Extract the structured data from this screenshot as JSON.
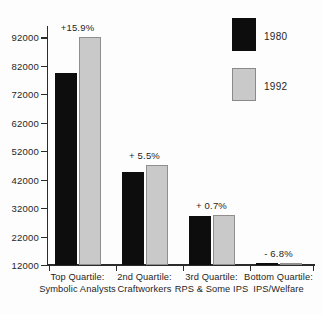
{
  "chart_data": {
    "type": "bar",
    "title": "",
    "subtitle": "",
    "xlabel": "",
    "ylabel": "",
    "ylim": [
      12000,
      96000
    ],
    "grid": false,
    "legend_position": "top-right",
    "categories": [
      "Top Quartile:\nSymbolic Analysts",
      "2nd Quartile:\nCraftworkers",
      "3rd Quartile:\nRPS & Some IPS",
      "Bottom Quartile:\nIPS/Welfare"
    ],
    "category_lines": [
      [
        "Top Quartile:",
        "Symbolic Analysts"
      ],
      [
        "2nd Quartile:",
        "Craftworkers"
      ],
      [
        "3rd Quartile:",
        "RPS & Some IPS"
      ],
      [
        "Bottom Quartile:",
        "IPS/Welfare"
      ]
    ],
    "series": [
      {
        "name": "1980",
        "color": "#0d0d0d",
        "values": [
          79600,
          44600,
          29300,
          12600
        ]
      },
      {
        "name": "1992",
        "color": "#c9c9c9",
        "values": [
          92250,
          47050,
          29500,
          12450
        ]
      }
    ],
    "annotations": [
      "+15.9%",
      "+ 5.5%",
      "+ 0.7%",
      "- 6.8%"
    ],
    "y_ticks": [
      12000,
      22000,
      32000,
      42000,
      52000,
      62000,
      72000,
      82000,
      92000
    ],
    "y_tick_labels": [
      "12000",
      "22000",
      "32000",
      "42000",
      "52000",
      "62000",
      "72000",
      "82000",
      "92000"
    ]
  },
  "legend": {
    "items": [
      {
        "label": "1980",
        "swatch": "black-swatch"
      },
      {
        "label": "1992",
        "swatch": "gray-swatch"
      }
    ]
  }
}
